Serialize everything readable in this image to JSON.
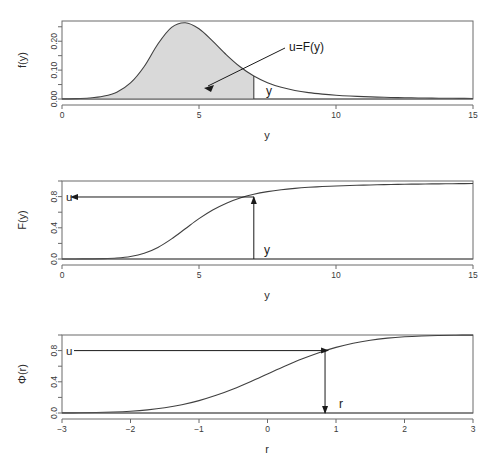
{
  "figure": {
    "title": "",
    "panel_count": 3
  },
  "chart_data": [
    {
      "type": "area",
      "panel_id": "density",
      "title": "",
      "xlabel": "y",
      "ylabel": "f(y)",
      "xlim": [
        0,
        15
      ],
      "ylim": [
        0,
        0.27
      ],
      "xticks": [
        0,
        5,
        10,
        15
      ],
      "xticklabels": [
        "0",
        "5",
        "10",
        "15"
      ],
      "yticks": [
        0.0,
        0.05,
        0.1,
        0.15,
        0.2,
        0.25
      ],
      "yticklabels": [
        "0.00",
        "",
        "0.10",
        "",
        "0.20",
        ""
      ],
      "grid": false,
      "legend": "none",
      "fill_color": "#d9d9d9",
      "line_color": "#404040",
      "shaded_region": {
        "from": 0,
        "to": 7,
        "label": "u=F(y)"
      },
      "annotations": [
        {
          "text": "u=F(y)",
          "x": 9.2,
          "y": 0.205,
          "kind": "arrow-label"
        },
        {
          "text": "y",
          "x": 7.25,
          "y": 0.022,
          "kind": "point-label"
        }
      ],
      "x": [
        0.0,
        0.5,
        1.0,
        1.5,
        2.0,
        2.5,
        3.0,
        3.5,
        4.0,
        4.5,
        5.0,
        5.5,
        6.0,
        6.5,
        7.0,
        7.5,
        8.0,
        8.5,
        9.0,
        9.5,
        10.0,
        10.5,
        11.0,
        11.5,
        12.0,
        12.5,
        13.0,
        13.5,
        14.0,
        14.5,
        15.0
      ],
      "y": [
        0.0005,
        0.0012,
        0.0035,
        0.0095,
        0.0235,
        0.0555,
        0.1125,
        0.1905,
        0.248,
        0.264,
        0.243,
        0.2,
        0.153,
        0.1115,
        0.0795,
        0.0565,
        0.0405,
        0.0295,
        0.022,
        0.0168,
        0.013,
        0.0102,
        0.0082,
        0.0066,
        0.0054,
        0.0045,
        0.0037,
        0.0031,
        0.0026,
        0.0022,
        0.0019
      ]
    },
    {
      "type": "line",
      "panel_id": "cdf",
      "title": "",
      "xlabel": "y",
      "ylabel": "F(y)",
      "xlim": [
        0,
        15
      ],
      "ylim": [
        0,
        1.0
      ],
      "xticks": [
        0,
        5,
        10,
        15
      ],
      "xticklabels": [
        "0",
        "5",
        "10",
        "15"
      ],
      "yticks": [
        0.0,
        0.2,
        0.4,
        0.6,
        0.8,
        1.0
      ],
      "yticklabels": [
        "0.0",
        "",
        "0.4",
        "",
        "0.8",
        ""
      ],
      "grid": false,
      "legend": "none",
      "line_color": "#404040",
      "annotations": [
        {
          "text": "u",
          "x": 0.25,
          "y": 0.8,
          "kind": "axis-label"
        },
        {
          "text": "y",
          "x": 7.35,
          "y": 0.1,
          "kind": "point-label"
        }
      ],
      "markers": [
        {
          "x": 7.0,
          "y": 0.795,
          "label": "u=F(y)"
        }
      ],
      "x": [
        0.0,
        0.5,
        1.0,
        1.5,
        2.0,
        2.5,
        3.0,
        3.5,
        4.0,
        4.5,
        5.0,
        5.5,
        6.0,
        6.5,
        7.0,
        7.5,
        8.0,
        8.5,
        9.0,
        9.5,
        10.0,
        10.5,
        11.0,
        11.5,
        12.0,
        12.5,
        13.0,
        13.5,
        14.0,
        14.5,
        15.0
      ],
      "y": [
        0.0002,
        0.0006,
        0.0017,
        0.0047,
        0.0128,
        0.032,
        0.073,
        0.148,
        0.258,
        0.388,
        0.517,
        0.628,
        0.716,
        0.782,
        0.83,
        0.864,
        0.8885,
        0.906,
        0.919,
        0.929,
        0.9365,
        0.9425,
        0.9475,
        0.9515,
        0.955,
        0.958,
        0.9605,
        0.9625,
        0.9645,
        0.966,
        0.9675
      ]
    },
    {
      "type": "line",
      "panel_id": "normal",
      "title": "",
      "xlabel": "r",
      "ylabel": "Φ(r)",
      "xlim": [
        -3,
        3
      ],
      "ylim": [
        0,
        1.0
      ],
      "xticks": [
        -3,
        -2,
        -1,
        0,
        1,
        2,
        3
      ],
      "xticklabels": [
        "−3",
        "−2",
        "−1",
        "0",
        "1",
        "2",
        "3"
      ],
      "yticks": [
        0.0,
        0.2,
        0.4,
        0.6,
        0.8,
        1.0
      ],
      "yticklabels": [
        "0.0",
        "",
        "0.4",
        "",
        "0.8",
        ""
      ],
      "grid": false,
      "legend": "none",
      "line_color": "#404040",
      "annotations": [
        {
          "text": "u",
          "x": -2.88,
          "y": 0.8,
          "kind": "axis-label"
        },
        {
          "text": "r",
          "x": 1.05,
          "y": 0.09,
          "kind": "point-label"
        }
      ],
      "markers": [
        {
          "x": 0.84,
          "y": 0.8,
          "label": "u=Φ(r)"
        }
      ],
      "x": [
        -3.0,
        -2.75,
        -2.5,
        -2.25,
        -2.0,
        -1.75,
        -1.5,
        -1.25,
        -1.0,
        -0.75,
        -0.5,
        -0.25,
        0.0,
        0.25,
        0.5,
        0.75,
        1.0,
        1.25,
        1.5,
        1.75,
        2.0,
        2.25,
        2.5,
        2.75,
        3.0
      ],
      "y": [
        0.0013,
        0.003,
        0.0062,
        0.0122,
        0.0228,
        0.0401,
        0.0668,
        0.1056,
        0.1587,
        0.2266,
        0.3085,
        0.4013,
        0.5,
        0.5987,
        0.6915,
        0.7734,
        0.8413,
        0.8944,
        0.9332,
        0.9599,
        0.9772,
        0.9878,
        0.9938,
        0.997,
        0.9987
      ]
    }
  ]
}
